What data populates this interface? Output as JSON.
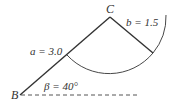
{
  "diagram": {
    "points": {
      "B": {
        "label": "B",
        "x": 20,
        "y": 95
      },
      "C": {
        "label": "C",
        "x": 110,
        "y": 17
      }
    },
    "labels": {
      "a": "a = 3.0",
      "b": "b = 1.5",
      "beta": "β = 40°"
    },
    "colors": {
      "line": "#333333",
      "dashed": "#555555"
    }
  }
}
